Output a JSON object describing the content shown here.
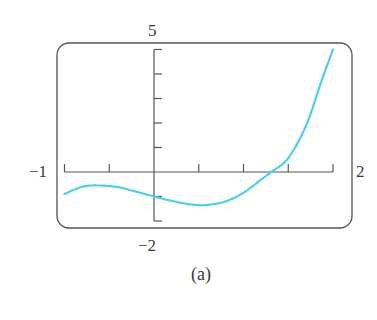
{
  "chart_data": {
    "type": "line",
    "title": "",
    "caption": "(a)",
    "xlabel": "",
    "ylabel": "",
    "xlim": [
      -1,
      2
    ],
    "ylim": [
      -2,
      5
    ],
    "x_tick_step": 0.5,
    "y_tick_step": 1,
    "grid": false,
    "legend": null,
    "window_labels": {
      "xmin": "−1",
      "xmax": "2",
      "ymin": "−2",
      "ymax": "5"
    },
    "series": [
      {
        "name": "f(x)",
        "color": "#4fd0e6",
        "x": [
          -1.0,
          -0.8,
          -0.62,
          -0.4,
          -0.2,
          0.0,
          0.2,
          0.4,
          0.58,
          0.8,
          1.0,
          1.2,
          1.31,
          1.5,
          1.7,
          1.87,
          2.0
        ],
        "y": [
          -0.9,
          -0.6,
          -0.55,
          -0.62,
          -0.8,
          -1.0,
          -1.18,
          -1.32,
          -1.35,
          -1.2,
          -0.85,
          -0.3,
          0.0,
          0.57,
          1.9,
          3.7,
          5.0
        ]
      }
    ]
  },
  "layout": {
    "frame": {
      "x": 57,
      "y": 43,
      "w": 295,
      "h": 185,
      "r": 12,
      "stroke": "#555555"
    },
    "origin_px": {
      "x": 154,
      "y": 172
    },
    "px_per_unit": {
      "x": 89.5,
      "y": 24.5
    },
    "axis_color": "#555555"
  }
}
